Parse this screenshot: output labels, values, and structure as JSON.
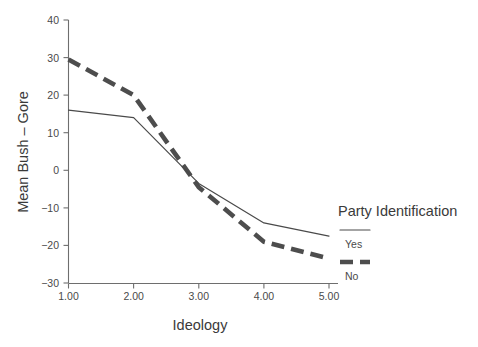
{
  "chart_data": {
    "type": "line",
    "title": "",
    "xlabel": "Ideology",
    "ylabel": "Mean Bush – Gore",
    "x": [
      1.0,
      2.0,
      3.0,
      4.0,
      5.0
    ],
    "x_tick_labels": [
      "1.00",
      "2.00",
      "3.00",
      "4.00",
      "5.00"
    ],
    "y_tick_labels": [
      "40",
      "30",
      "20",
      "10",
      "0",
      "−10",
      "−20",
      "−30"
    ],
    "y_ticks": [
      40,
      30,
      20,
      10,
      0,
      -10,
      -20,
      -30
    ],
    "ylim": [
      -30,
      40
    ],
    "xlim": [
      1.0,
      5.0
    ],
    "grid": false,
    "legend_position": "right",
    "legend_title": "Party Identification",
    "series": [
      {
        "name": "Yes",
        "style": "solid",
        "color": "#4a4a4a",
        "values": [
          16.0,
          14.0,
          -3.5,
          -14.0,
          -17.5
        ]
      },
      {
        "name": "No",
        "style": "dashed",
        "color": "#4d4d4d",
        "values": [
          29.5,
          20.0,
          -4.5,
          -19.0,
          -23.5
        ]
      }
    ]
  },
  "axes": {
    "x_label": "Ideology",
    "y_label": "Mean Bush – Gore"
  },
  "legend": {
    "title": "Party Identification",
    "entries": [
      {
        "label": "Yes",
        "style": "solid"
      },
      {
        "label": "No",
        "style": "dashed"
      }
    ]
  },
  "ticks": {
    "y": [
      "40",
      "30",
      "20",
      "10",
      "0",
      "−10",
      "−20",
      "−30"
    ],
    "x": [
      "1.00",
      "2.00",
      "3.00",
      "4.00",
      "5.00"
    ]
  }
}
